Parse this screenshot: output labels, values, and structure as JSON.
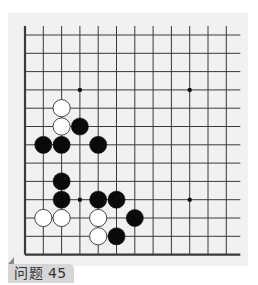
{
  "problem": {
    "label": "问题 45"
  },
  "board": {
    "columns": 12,
    "rows": 13,
    "origin_x": 25,
    "origin_y": 35,
    "cell": 18.3,
    "line_color": "#3a3a3a",
    "right_overhang": 14,
    "top_overhang": 9,
    "edges": {
      "left": true,
      "bottom": true,
      "top": false,
      "right": false
    },
    "star_points": [
      [
        3,
        3
      ],
      [
        9,
        3
      ],
      [
        3,
        9
      ],
      [
        9,
        9
      ]
    ],
    "stones": [
      {
        "color": "white",
        "col": 2,
        "row": 4
      },
      {
        "color": "white",
        "col": 2,
        "row": 5
      },
      {
        "color": "black",
        "col": 3,
        "row": 5
      },
      {
        "color": "black",
        "col": 1,
        "row": 6
      },
      {
        "color": "black",
        "col": 2,
        "row": 6
      },
      {
        "color": "black",
        "col": 4,
        "row": 6
      },
      {
        "color": "black",
        "col": 2,
        "row": 8
      },
      {
        "color": "black",
        "col": 2,
        "row": 9
      },
      {
        "color": "black",
        "col": 4,
        "row": 9
      },
      {
        "color": "black",
        "col": 5,
        "row": 9
      },
      {
        "color": "white",
        "col": 1,
        "row": 10
      },
      {
        "color": "white",
        "col": 2,
        "row": 10
      },
      {
        "color": "white",
        "col": 4,
        "row": 10
      },
      {
        "color": "black",
        "col": 6,
        "row": 10
      },
      {
        "color": "white",
        "col": 4,
        "row": 11
      },
      {
        "color": "black",
        "col": 5,
        "row": 11
      }
    ],
    "colors": {
      "black_stone": "#0a0a0a",
      "white_stone": "#ffffff",
      "white_outline": "#333333",
      "panel": "#f1f1f1"
    }
  }
}
